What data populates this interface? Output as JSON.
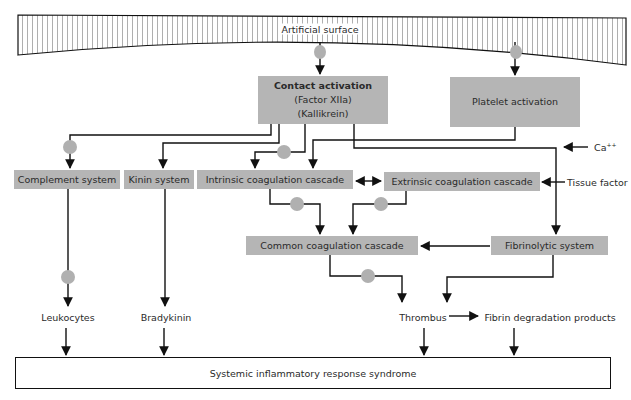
{
  "diagram": {
    "surface": {
      "label": "Artificial surface"
    },
    "nodes": {
      "contact_activation": {
        "title": "Contact activation",
        "line2": "(Factor XIIa)",
        "line3": "(Kallikrein)"
      },
      "platelet_activation": {
        "label": "Platelet activation"
      },
      "complement_system": {
        "label": "Complement system"
      },
      "kinin_system": {
        "label": "Kinin system"
      },
      "intrinsic_cascade": {
        "label": "Intrinsic coagulation cascade"
      },
      "extrinsic_cascade": {
        "label": "Extrinsic coagulation cascade"
      },
      "common_cascade": {
        "label": "Common coagulation cascade"
      },
      "fibrinolytic_system": {
        "label": "Fibrinolytic system"
      },
      "sirs": {
        "label": "Systemic inflammatory response syndrome"
      }
    },
    "inputs": {
      "calcium": {
        "base": "Ca",
        "superscript": "++"
      },
      "tissue_factor": {
        "label": "Tissue factor"
      }
    },
    "products": {
      "leukocytes": {
        "label": "Leukocytes"
      },
      "bradykinin": {
        "label": "Bradykinin"
      },
      "thrombus": {
        "label": "Thrombus"
      },
      "fibrin_degradation": {
        "label": "Fibrin degradation products"
      }
    },
    "colors": {
      "box_fill": "#b5b5b5",
      "node_circle": "#b0b0b0",
      "line": "#111111"
    },
    "edges": [
      {
        "from": "Artificial surface",
        "to": "Contact activation",
        "via_node": true
      },
      {
        "from": "Artificial surface",
        "to": "Platelet activation",
        "via_node": true
      },
      {
        "from": "Contact activation",
        "to": "Complement system",
        "via_node": true
      },
      {
        "from": "Contact activation",
        "to": "Kinin system"
      },
      {
        "from": "Contact activation",
        "to": "Intrinsic coagulation cascade",
        "via_node": true
      },
      {
        "from": "Platelet activation",
        "to": "Intrinsic coagulation cascade"
      },
      {
        "from": "Contact activation",
        "to": "Fibrinolytic system"
      },
      {
        "from": "Intrinsic coagulation cascade",
        "to": "Extrinsic coagulation cascade",
        "bidirectional": true
      },
      {
        "from": "Ca++",
        "to": "Fibrinolytic pathway line"
      },
      {
        "from": "Tissue factor",
        "to": "Extrinsic coagulation cascade"
      },
      {
        "from": "Intrinsic coagulation cascade",
        "to": "Common coagulation cascade",
        "via_node": true
      },
      {
        "from": "Extrinsic coagulation cascade",
        "to": "Common coagulation cascade",
        "via_node": true
      },
      {
        "from": "Fibrinolytic system",
        "to": "Common coagulation cascade"
      },
      {
        "from": "Complement system",
        "to": "Leukocytes",
        "via_node": true
      },
      {
        "from": "Kinin system",
        "to": "Bradykinin"
      },
      {
        "from": "Common coagulation cascade",
        "to": "Thrombus",
        "via_node": true
      },
      {
        "from": "Fibrinolytic system",
        "to": "Thrombus"
      },
      {
        "from": "Thrombus",
        "to": "Fibrin degradation products"
      },
      {
        "from": "Leukocytes",
        "to": "Systemic inflammatory response syndrome"
      },
      {
        "from": "Bradykinin",
        "to": "Systemic inflammatory response syndrome"
      },
      {
        "from": "Thrombus",
        "to": "Systemic inflammatory response syndrome"
      },
      {
        "from": "Fibrin degradation products",
        "to": "Systemic inflammatory response syndrome"
      }
    ]
  }
}
